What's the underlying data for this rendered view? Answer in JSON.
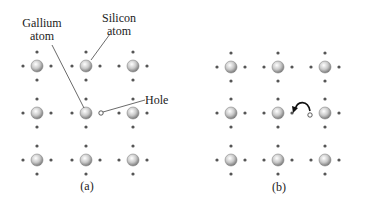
{
  "panel_a": {
    "caption": "(a)",
    "labels": {
      "gallium": [
        "Gallium",
        "atom"
      ],
      "silicon": [
        "Silicon",
        "atom"
      ],
      "hole": "Hole"
    },
    "columns_x": [
      37,
      86,
      133
    ],
    "rows_y": [
      66,
      113,
      160
    ],
    "hole": {
      "x": 101,
      "y": 113
    }
  },
  "panel_b": {
    "caption": "(b)",
    "columns_x": [
      231,
      278,
      325
    ],
    "rows_y": [
      67,
      113,
      160
    ],
    "hole": {
      "x": 310,
      "y": 115
    },
    "arrow_from": {
      "x": 294,
      "y": 113
    }
  },
  "colors": {
    "atom_fill": "#d8d8d8",
    "atom_stroke": "#888888",
    "electron": "#555555",
    "line": "#444444"
  }
}
